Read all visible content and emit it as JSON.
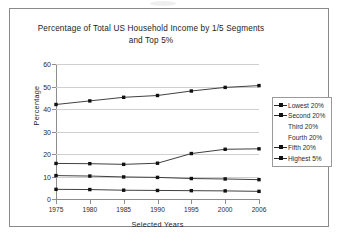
{
  "chart_data": {
    "type": "line",
    "title": "Percentage of Total US Household Income by 1/5 Segments and Top 5%",
    "title_line1": "Percentage of Total US Household Income by 1/5 Segments",
    "title_line2": "and Top 5%",
    "xlabel": "Selected Years",
    "ylabel": "Percentage",
    "x": [
      "1975",
      "1980",
      "1985",
      "1990",
      "1995",
      "2000",
      "2006"
    ],
    "ylim": [
      0,
      60
    ],
    "yticks": [
      0,
      10,
      20,
      30,
      40,
      50,
      60
    ],
    "grid": true,
    "legend_position": "right",
    "series": [
      {
        "name": "Lowest 20%",
        "values": [
          4.3,
          4.2,
          3.9,
          3.8,
          3.7,
          3.6,
          3.4
        ],
        "marker": true
      },
      {
        "name": "Second 20%",
        "values": [
          10.4,
          10.2,
          9.8,
          9.6,
          9.1,
          8.9,
          8.6
        ],
        "marker": true
      },
      {
        "name": "Third 20%",
        "values": [
          10.4,
          10.2,
          9.8,
          9.6,
          9.1,
          8.9,
          8.6
        ],
        "marker": false
      },
      {
        "name": "Fourth 20%",
        "values": [
          15.8,
          15.7,
          15.4,
          15.9,
          15.2,
          14.9,
          14.5
        ],
        "marker": false
      },
      {
        "name": "Fifth 20%",
        "values": [
          15.8,
          15.7,
          15.4,
          15.9,
          20.2,
          22.1,
          22.3
        ],
        "marker": true
      },
      {
        "name": "Highest 5%",
        "values": [
          42.0,
          43.6,
          45.2,
          46.0,
          48.0,
          49.6,
          50.4
        ],
        "marker": true
      }
    ],
    "plotted_lines": [
      {
        "key": "top-line",
        "values": [
          42.0,
          43.6,
          45.2,
          46.0,
          48.0,
          49.6,
          50.4
        ]
      },
      {
        "key": "mid-line",
        "values": [
          15.8,
          15.7,
          15.4,
          15.9,
          20.2,
          22.1,
          22.3
        ]
      },
      {
        "key": "lower-line",
        "values": [
          10.4,
          10.2,
          9.8,
          9.6,
          9.1,
          8.9,
          8.6
        ]
      },
      {
        "key": "bottom-line",
        "values": [
          4.3,
          4.2,
          3.9,
          3.8,
          3.7,
          3.6,
          3.4
        ]
      }
    ],
    "colors": {
      "line": "#2a2a2a",
      "marker": "#111111",
      "grid": "#cfcfcf",
      "axis": "#8d8d8d"
    }
  },
  "legend": {
    "items": [
      {
        "label": "Lowest 20%",
        "marker": true
      },
      {
        "label": "Second 20%",
        "marker": true
      },
      {
        "label": "Third 20%",
        "marker": false
      },
      {
        "label": "Fourth 20%",
        "marker": false
      },
      {
        "label": "Fifth 20%",
        "marker": true
      },
      {
        "label": "Highest 5%",
        "marker": true
      }
    ]
  }
}
